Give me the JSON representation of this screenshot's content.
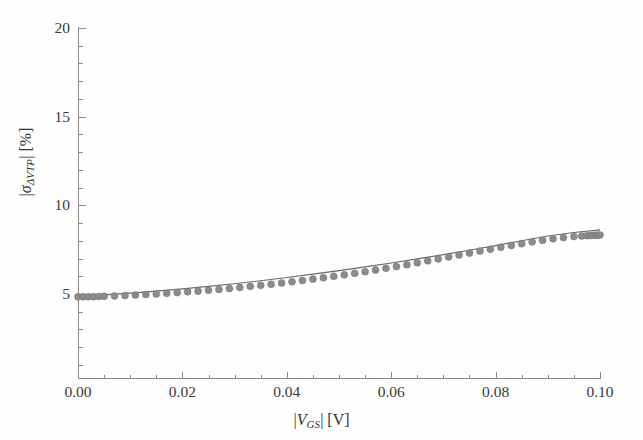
{
  "figure": {
    "background_color": "#fefefe",
    "axis_color": "#8a8a8a",
    "marker_color": "#8b8b8b",
    "line_color": "#6a6a6a"
  },
  "axes": {
    "x": {
      "label_parts": {
        "abs_open": "|",
        "var": "V",
        "sub": "GS",
        "abs_close": "|",
        "unit": "[V]"
      },
      "label_plain": "|V_GS| [V]",
      "tick_labels": [
        "0.00",
        "0.02",
        "0.04",
        "0.06",
        "0.08",
        "0.10"
      ],
      "tick_values": [
        0.0,
        0.02,
        0.04,
        0.06,
        0.08,
        0.1
      ],
      "minor_tick_step": 0.005,
      "range": [
        0.0,
        0.1002
      ]
    },
    "y": {
      "label_parts": {
        "abs_open": "|",
        "var": "σ",
        "sub": "ΔVTP",
        "abs_close": "|",
        "unit": "[%]"
      },
      "label_plain": "|sigma_dVTP| [%]",
      "tick_labels": [
        "20",
        "15",
        "10",
        "5"
      ],
      "tick_values": [
        20,
        15,
        10,
        5
      ],
      "minor_tick_step": 1,
      "range": [
        0.25,
        20.0
      ]
    }
  },
  "chart_data": {
    "type": "scatter",
    "title": "",
    "xlabel": "|V_GS| [V]",
    "ylabel": "|sigma_dVTP| [%]",
    "xlim": [
      0.0,
      0.1002
    ],
    "ylim": [
      0.25,
      20.0
    ],
    "grid": false,
    "legend": null,
    "series": [
      {
        "name": "data-points",
        "style": "markers",
        "marker": "filled-circle",
        "color": "#8b8b8b",
        "x": [
          0.0,
          0.001,
          0.002,
          0.003,
          0.004,
          0.005,
          0.007,
          0.009,
          0.011,
          0.013,
          0.015,
          0.017,
          0.019,
          0.021,
          0.023,
          0.025,
          0.027,
          0.029,
          0.031,
          0.033,
          0.035,
          0.037,
          0.039,
          0.041,
          0.043,
          0.045,
          0.047,
          0.049,
          0.051,
          0.053,
          0.055,
          0.057,
          0.059,
          0.061,
          0.063,
          0.065,
          0.067,
          0.069,
          0.071,
          0.073,
          0.075,
          0.077,
          0.079,
          0.081,
          0.083,
          0.085,
          0.087,
          0.089,
          0.091,
          0.093,
          0.095,
          0.0965,
          0.0975,
          0.0982,
          0.0988,
          0.0993,
          0.0997,
          0.1
        ],
        "y": [
          4.84,
          4.84,
          4.85,
          4.85,
          4.86,
          4.87,
          4.89,
          4.91,
          4.94,
          4.97,
          5.0,
          5.04,
          5.08,
          5.12,
          5.16,
          5.21,
          5.26,
          5.31,
          5.37,
          5.43,
          5.49,
          5.55,
          5.62,
          5.69,
          5.76,
          5.84,
          5.92,
          6.0,
          6.08,
          6.17,
          6.26,
          6.35,
          6.45,
          6.55,
          6.65,
          6.76,
          6.87,
          6.98,
          7.09,
          7.2,
          7.31,
          7.42,
          7.53,
          7.64,
          7.74,
          7.84,
          7.94,
          8.03,
          8.11,
          8.18,
          8.24,
          8.27,
          8.29,
          8.3,
          8.31,
          8.32,
          8.32,
          8.33
        ]
      },
      {
        "name": "model-fit",
        "style": "line",
        "color": "#6a6a6a",
        "x": [
          0.0,
          0.005,
          0.01,
          0.015,
          0.02,
          0.025,
          0.03,
          0.035,
          0.04,
          0.045,
          0.05,
          0.055,
          0.06,
          0.065,
          0.07,
          0.075,
          0.08,
          0.085,
          0.09,
          0.095,
          0.1
        ],
        "y": [
          4.88,
          4.95,
          5.05,
          5.16,
          5.29,
          5.43,
          5.58,
          5.75,
          5.93,
          6.12,
          6.32,
          6.53,
          6.75,
          6.98,
          7.22,
          7.47,
          7.73,
          8.0,
          8.27,
          8.47,
          8.62
        ]
      }
    ]
  }
}
